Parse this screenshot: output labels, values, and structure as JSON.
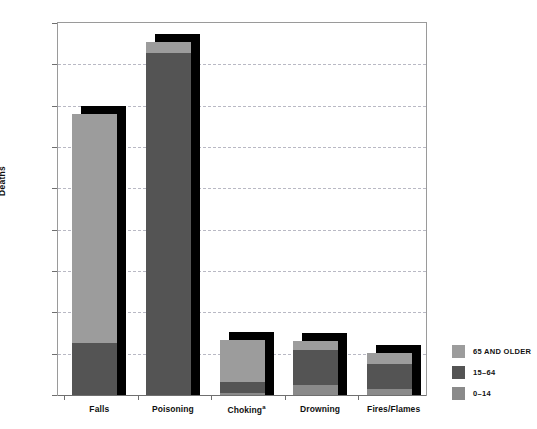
{
  "chart_data": {
    "type": "bar",
    "title": "",
    "subtitle": "",
    "xlabel": "",
    "ylabel": "Deaths",
    "ylim": [
      0,
      27000
    ],
    "ytick_step": 3000,
    "grid": true,
    "stacked": true,
    "legend_position": "right",
    "yticks": [
      "0",
      "3,000",
      "6,000",
      "9,000",
      "12,000",
      "15,000",
      "18,000",
      "21,000",
      "24,000",
      "27,000"
    ],
    "ytick_values": [
      0,
      3000,
      6000,
      9000,
      12000,
      15000,
      18000,
      21000,
      24000,
      27000
    ],
    "categories": [
      "Falls",
      "Poisoning",
      "Choking",
      "Drowning",
      "Fires/Flames"
    ],
    "category_footnotes": [
      "",
      "",
      "a",
      "",
      ""
    ],
    "series": [
      {
        "name": "0–14",
        "color": "#8a8a8a",
        "values": [
          0,
          0,
          150,
          700,
          450
        ]
      },
      {
        "name": "15–64",
        "color": "#545454",
        "values": [
          3800,
          24800,
          800,
          2550,
          1800
        ]
      },
      {
        "name": "65 AND OLDER",
        "color": "#9c9c9c",
        "values": [
          16600,
          800,
          3050,
          700,
          800
        ]
      }
    ],
    "totals": [
      20400,
      25600,
      4000,
      3950,
      3050
    ],
    "annotations": []
  },
  "legend": {
    "items": [
      {
        "label": "65 AND OLDER",
        "color": "#9c9c9c"
      },
      {
        "label": "15–64",
        "color": "#545454"
      },
      {
        "label": "0–14",
        "color": "#8a8a8a"
      }
    ]
  },
  "colors": {
    "background": "#ffffff",
    "axis": "#6f6f6f",
    "frame": "#9a9a9a",
    "grid": "#b9b9c4",
    "shadow": "#000000",
    "text": "#111111"
  }
}
